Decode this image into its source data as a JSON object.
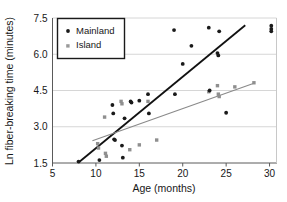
{
  "chart_data": {
    "type": "scatter",
    "title": "",
    "xlabel": "Age (months)",
    "ylabel": "Ln fiber-breaking time (minutes)",
    "xlim": [
      5,
      30.8
    ],
    "ylim": [
      1.5,
      7.5
    ],
    "xticks": [
      "5",
      "10",
      "15",
      "20",
      "25",
      "30"
    ],
    "xtick_values": [
      5,
      10,
      15,
      20,
      25,
      30
    ],
    "yticks": [
      "1.5",
      "3.0",
      "4.5",
      "6.0",
      "7.5"
    ],
    "ytick_values": [
      1.5,
      3.0,
      4.5,
      6.0,
      7.5
    ],
    "grid": "horizontal",
    "legend_position": "top-left",
    "series": [
      {
        "name": "Mainland",
        "marker": "filled-circle",
        "color": "#1a1a1a",
        "points": [
          [
            8.0,
            1.56
          ],
          [
            10.4,
            1.62
          ],
          [
            11.9,
            3.9
          ],
          [
            12.0,
            3.55
          ],
          [
            12.1,
            2.48
          ],
          [
            12.2,
            2.45
          ],
          [
            13.0,
            2.22
          ],
          [
            13.1,
            1.72
          ],
          [
            13.3,
            3.35
          ],
          [
            14.0,
            4.05
          ],
          [
            14.1,
            4.0
          ],
          [
            15.0,
            4.08
          ],
          [
            16.0,
            4.35
          ],
          [
            16.1,
            3.55
          ],
          [
            19.0,
            7.0
          ],
          [
            19.1,
            4.35
          ],
          [
            20.0,
            5.6
          ],
          [
            21.0,
            6.35
          ],
          [
            23.0,
            7.1
          ],
          [
            23.1,
            4.5
          ],
          [
            24.0,
            6.05
          ],
          [
            24.1,
            5.95
          ],
          [
            24.2,
            6.95
          ],
          [
            25.0,
            3.58
          ],
          [
            30.2,
            7.18
          ],
          [
            30.2,
            7.05
          ],
          [
            30.2,
            6.95
          ]
        ],
        "trendline": {
          "x0": 8.0,
          "y0": 1.52,
          "x1": 27.2,
          "y1": 7.2
        }
      },
      {
        "name": "Island",
        "marker": "filled-square-grey",
        "color": "#8f8f8f",
        "points": [
          [
            10.2,
            2.3
          ],
          [
            10.3,
            2.12
          ],
          [
            11.0,
            3.4
          ],
          [
            11.1,
            1.9
          ],
          [
            11.2,
            1.78
          ],
          [
            12.9,
            4.05
          ],
          [
            13.0,
            3.95
          ],
          [
            13.9,
            2.05
          ],
          [
            15.0,
            2.25
          ],
          [
            16.0,
            4.05
          ],
          [
            17.0,
            2.45
          ],
          [
            23.0,
            4.45
          ],
          [
            24.0,
            4.7
          ],
          [
            24.1,
            4.35
          ],
          [
            24.2,
            4.25
          ],
          [
            26.0,
            4.65
          ],
          [
            28.2,
            4.82
          ]
        ],
        "trendline": {
          "x0": 9.6,
          "y0": 2.42,
          "x1": 28.2,
          "y1": 4.8
        }
      }
    ]
  },
  "legend": {
    "items": [
      {
        "label": "Mainland",
        "marker": "filled-circle"
      },
      {
        "label": "Island",
        "marker": "filled-square-grey"
      }
    ]
  },
  "axes": {
    "x_title": "Age (months)",
    "y_title": "Ln fiber-breaking time (minutes)"
  }
}
